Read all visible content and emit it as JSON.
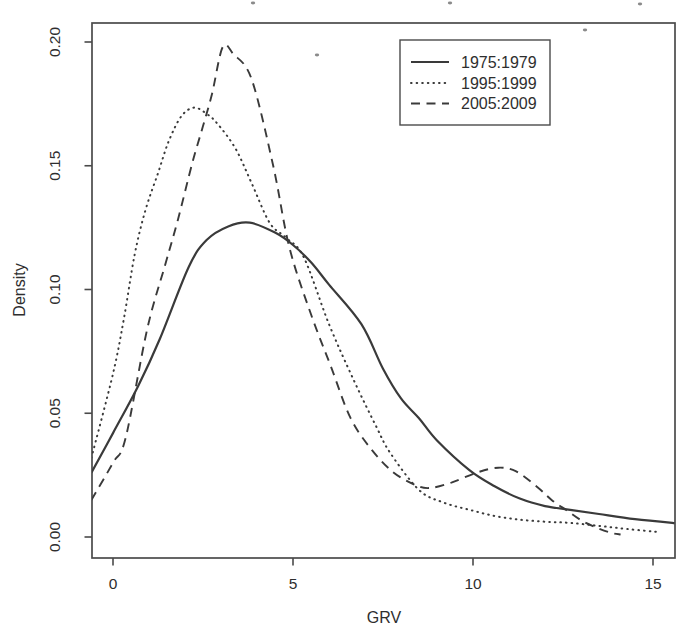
{
  "figure": {
    "background": "#ffffff",
    "curve_color": "#3a3a3a",
    "axis_color": "#4a4a4a",
    "text_color": "#2e2e2e"
  },
  "chart_data": {
    "type": "line",
    "title": "",
    "xlabel": "GRV",
    "ylabel": "Density",
    "xlim": [
      -0.58,
      15.6
    ],
    "ylim": [
      -0.0085,
      0.2077
    ],
    "grid": false,
    "legend_position": "top-right",
    "x_ticks": [
      {
        "label": "0",
        "value": 0
      },
      {
        "label": "5",
        "value": 5
      },
      {
        "label": "10",
        "value": 10
      },
      {
        "label": "15",
        "value": 15
      }
    ],
    "y_ticks": [
      {
        "label": "0.00",
        "value": 0.0
      },
      {
        "label": "0.05",
        "value": 0.05
      },
      {
        "label": "0.10",
        "value": 0.1
      },
      {
        "label": "0.15",
        "value": 0.15
      },
      {
        "label": "0.20",
        "value": 0.2
      }
    ],
    "series": [
      {
        "name": "1975:1979",
        "style": "solid",
        "points": [
          [
            -0.6,
            0.026
          ],
          [
            0,
            0.042
          ],
          [
            0.7,
            0.061
          ],
          [
            1.3,
            0.08
          ],
          [
            2.1,
            0.109
          ],
          [
            2.6,
            0.12
          ],
          [
            3.2,
            0.1255
          ],
          [
            3.8,
            0.127
          ],
          [
            4.5,
            0.123
          ],
          [
            5,
            0.118
          ],
          [
            5.5,
            0.111
          ],
          [
            6,
            0.102
          ],
          [
            6.9,
            0.086
          ],
          [
            7.5,
            0.068
          ],
          [
            8,
            0.056
          ],
          [
            8.5,
            0.048
          ],
          [
            9,
            0.039
          ],
          [
            9.9,
            0.027
          ],
          [
            10.6,
            0.0205
          ],
          [
            11.3,
            0.0155
          ],
          [
            12,
            0.0125
          ],
          [
            12.7,
            0.011
          ],
          [
            13.5,
            0.0093
          ],
          [
            14.5,
            0.0072
          ],
          [
            15.6,
            0.0056
          ]
        ]
      },
      {
        "name": "1995:1999",
        "style": "dotted",
        "points": [
          [
            -0.6,
            0.032
          ],
          [
            0,
            0.066
          ],
          [
            0.3,
            0.088
          ],
          [
            0.6,
            0.114
          ],
          [
            0.9,
            0.132
          ],
          [
            1.25,
            0.147
          ],
          [
            1.55,
            0.16
          ],
          [
            1.9,
            0.17
          ],
          [
            2.25,
            0.1735
          ],
          [
            2.6,
            0.171
          ],
          [
            2.9,
            0.167
          ],
          [
            3.4,
            0.157
          ],
          [
            3.85,
            0.143
          ],
          [
            4.35,
            0.127
          ],
          [
            4.8,
            0.121
          ],
          [
            5.3,
            0.113
          ],
          [
            6,
            0.086
          ],
          [
            6.7,
            0.063
          ],
          [
            7.3,
            0.045
          ],
          [
            7.7,
            0.034
          ],
          [
            8.5,
            0.019
          ],
          [
            9.2,
            0.0138
          ],
          [
            9.9,
            0.011
          ],
          [
            10.6,
            0.0085
          ],
          [
            11.3,
            0.007
          ],
          [
            12,
            0.0062
          ],
          [
            12.7,
            0.0057
          ],
          [
            13.5,
            0.0045
          ],
          [
            14.3,
            0.0032
          ],
          [
            15.2,
            0.002
          ]
        ]
      },
      {
        "name": "2005:2009",
        "style": "dashed",
        "points": [
          [
            -0.6,
            0.015
          ],
          [
            0,
            0.03
          ],
          [
            0.35,
            0.04
          ],
          [
            0.95,
            0.084
          ],
          [
            1.45,
            0.11
          ],
          [
            1.8,
            0.128
          ],
          [
            2.2,
            0.151
          ],
          [
            2.5,
            0.166
          ],
          [
            2.75,
            0.179
          ],
          [
            3.05,
            0.198
          ],
          [
            3.35,
            0.195
          ],
          [
            3.85,
            0.185
          ],
          [
            4.45,
            0.15
          ],
          [
            4.9,
            0.117
          ],
          [
            5.5,
            0.09
          ],
          [
            6.05,
            0.069
          ],
          [
            6.6,
            0.048
          ],
          [
            7.2,
            0.035
          ],
          [
            7.8,
            0.026
          ],
          [
            8.4,
            0.021
          ],
          [
            8.8,
            0.0198
          ],
          [
            9.4,
            0.022
          ],
          [
            10.1,
            0.026
          ],
          [
            10.7,
            0.028
          ],
          [
            11.2,
            0.0265
          ],
          [
            11.8,
            0.02
          ],
          [
            12.2,
            0.0148
          ],
          [
            12.6,
            0.0108
          ],
          [
            13,
            0.0068
          ],
          [
            13.4,
            0.004
          ],
          [
            13.8,
            0.0018
          ],
          [
            14.1,
            0.001
          ]
        ]
      }
    ]
  },
  "scan_artifacts": {
    "specks": [
      {
        "x": 253,
        "y": 3
      },
      {
        "x": 450,
        "y": 3
      },
      {
        "x": 640,
        "y": 4
      },
      {
        "x": 317,
        "y": 55
      },
      {
        "x": 585,
        "y": 30
      }
    ]
  }
}
